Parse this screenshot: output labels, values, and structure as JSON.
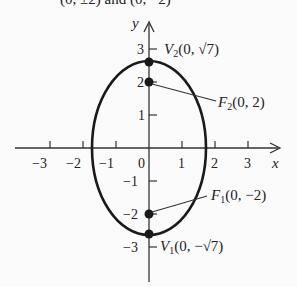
{
  "title_fragment": "(0, ±2) and (0, −2)",
  "axes": {
    "x_label": "x",
    "y_label": "y",
    "x_ticks": [
      "−3",
      "−2",
      "−1",
      "0",
      "1",
      "2",
      "3"
    ],
    "y_ticks": [
      "3",
      "2",
      "1",
      "−1",
      "−2",
      "−3"
    ]
  },
  "points": {
    "v2": {
      "name": "V",
      "sub": "2",
      "coords": "(0, √7)"
    },
    "f2": {
      "name": "F",
      "sub": "2",
      "coords": "(0, 2)"
    },
    "f1": {
      "name": "F",
      "sub": "1",
      "coords": "(0, −2)"
    },
    "v1": {
      "name": "V",
      "sub": "1",
      "coords": "(0, −√7)"
    }
  },
  "colors": {
    "curve": "#1a1a1a",
    "background": "#fbfbfb"
  }
}
